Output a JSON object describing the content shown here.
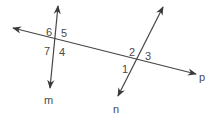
{
  "diagram": {
    "type": "transversal-lines",
    "colors": {
      "line": "#454545",
      "text": "#4a4a4a",
      "background": "#ffffff"
    },
    "lines": [
      {
        "name": "p",
        "label": "p",
        "x1": 13,
        "y1": 28,
        "x2": 196,
        "y2": 74,
        "label_x": 199,
        "label_y": 81
      },
      {
        "name": "m",
        "label": "m",
        "x1": 58,
        "y1": 6,
        "x2": 50,
        "y2": 88,
        "label_x": 44,
        "label_y": 104
      },
      {
        "name": "n",
        "label": "n",
        "x1": 163,
        "y1": 7,
        "x2": 118,
        "y2": 96,
        "label_x": 113,
        "label_y": 113
      }
    ],
    "angles": [
      {
        "label": "6",
        "x": 46,
        "y": 36
      },
      {
        "label": "5",
        "x": 61,
        "y": 37
      },
      {
        "label": "7",
        "x": 44,
        "y": 55
      },
      {
        "label": "4",
        "x": 59,
        "y": 56
      },
      {
        "label": "2",
        "x": 129,
        "y": 56
      },
      {
        "label": "3",
        "x": 145,
        "y": 60
      },
      {
        "label": "1",
        "x": 122,
        "y": 73
      }
    ]
  }
}
